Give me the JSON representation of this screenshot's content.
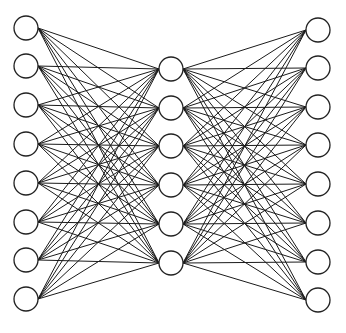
{
  "diagram": {
    "type": "fully-connected neural network (autoencoder)",
    "colors": {
      "edge": "#1a1a1a",
      "node_stroke": "#222222",
      "node_fill": "#ffffff",
      "background": "#ffffff"
    },
    "node_radius": 12,
    "layers": [
      {
        "name": "input",
        "x": 26,
        "y": [
          28,
          66,
          105,
          144,
          183,
          222,
          260,
          299
        ]
      },
      {
        "name": "hidden",
        "x": 171,
        "y": [
          69,
          108,
          146,
          185,
          224,
          263
        ]
      },
      {
        "name": "output",
        "x": 318,
        "y": [
          30,
          68,
          107,
          145,
          184,
          223,
          262,
          300
        ]
      }
    ]
  }
}
